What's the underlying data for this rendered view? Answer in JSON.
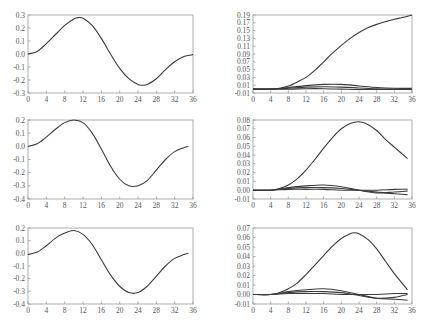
{
  "figure": {
    "rows": 3,
    "cols": 2,
    "line_color": "#3a3a3a",
    "frame_color": "#999999"
  },
  "chart_data": [
    {
      "type": "line",
      "panel": "row1-left",
      "title": "",
      "xlabel": "",
      "ylabel": "",
      "xlim": [
        0,
        36
      ],
      "ylim": [
        -0.3,
        0.3
      ],
      "xticks": [
        0,
        4,
        8,
        12,
        16,
        20,
        24,
        28,
        32,
        36
      ],
      "yticks": [
        -0.3,
        -0.2,
        -0.1,
        0.0,
        0.1,
        0.2,
        0.3
      ],
      "ytick_labels": [
        "-0.3",
        "-0.2",
        "-0.1",
        "0.0",
        "0.1",
        "0.2",
        "0.3"
      ],
      "grid": false,
      "legend": null,
      "series": [
        {
          "name": "response",
          "x": [
            0,
            2,
            4,
            6,
            8,
            10,
            11,
            12,
            14,
            16,
            18,
            20,
            22,
            24,
            25,
            26,
            28,
            30,
            32,
            34,
            36
          ],
          "values": [
            0.0,
            0.02,
            0.08,
            0.15,
            0.22,
            0.27,
            0.28,
            0.275,
            0.22,
            0.12,
            0.0,
            -0.11,
            -0.19,
            -0.235,
            -0.24,
            -0.235,
            -0.19,
            -0.12,
            -0.06,
            -0.02,
            -0.005
          ]
        }
      ]
    },
    {
      "type": "line",
      "panel": "row1-right",
      "title": "",
      "xlabel": "",
      "ylabel": "",
      "xlim": [
        0,
        36
      ],
      "ylim": [
        -0.01,
        0.19
      ],
      "xticks": [
        0,
        4,
        8,
        12,
        16,
        20,
        24,
        28,
        32,
        36
      ],
      "yticks": [
        -0.01,
        0.01,
        0.03,
        0.05,
        0.07,
        0.09,
        0.11,
        0.13,
        0.15,
        0.17,
        0.19
      ],
      "ytick_labels": [
        "-0.01",
        "0.01",
        "0.03",
        "0.05",
        "0.07",
        "0.09",
        "0.11",
        "0.13",
        "0.15",
        "0.17",
        "0.19"
      ],
      "grid": false,
      "legend": null,
      "series": [
        {
          "name": "s1",
          "x": [
            0,
            4,
            6,
            8,
            10,
            12,
            14,
            16,
            18,
            20,
            22,
            24,
            26,
            28,
            30,
            32,
            34,
            36
          ],
          "values": [
            0.0,
            0.0,
            0.002,
            0.008,
            0.018,
            0.03,
            0.048,
            0.07,
            0.092,
            0.112,
            0.13,
            0.145,
            0.157,
            0.166,
            0.173,
            0.179,
            0.184,
            0.19
          ]
        },
        {
          "name": "s2",
          "x": [
            0,
            4,
            8,
            12,
            16,
            20,
            24,
            28,
            32,
            36
          ],
          "values": [
            0.0,
            0.0,
            0.004,
            0.009,
            0.012,
            0.012,
            0.008,
            0.004,
            0.002,
            0.002
          ]
        },
        {
          "name": "s3",
          "x": [
            0,
            4,
            8,
            12,
            16,
            20,
            24,
            28,
            32,
            36
          ],
          "values": [
            0.0,
            0.0,
            0.002,
            0.005,
            0.006,
            0.005,
            0.003,
            0.001,
            0.0,
            0.0
          ]
        },
        {
          "name": "s4",
          "x": [
            0,
            4,
            8,
            12,
            16,
            20,
            24,
            28,
            32,
            36
          ],
          "values": [
            0.0,
            0.0,
            0.0,
            0.001,
            0.001,
            0.0,
            -0.001,
            -0.001,
            -0.001,
            -0.001
          ]
        }
      ]
    },
    {
      "type": "line",
      "panel": "row2-left",
      "title": "",
      "xlabel": "",
      "ylabel": "",
      "xlim": [
        0,
        36
      ],
      "ylim": [
        -0.4,
        0.2
      ],
      "xticks": [
        0,
        4,
        8,
        12,
        16,
        20,
        24,
        28,
        32,
        36
      ],
      "yticks": [
        -0.4,
        -0.3,
        -0.2,
        -0.1,
        0.0,
        0.1,
        0.2
      ],
      "ytick_labels": [
        "-0.4",
        "-0.3",
        "-0.2",
        "-0.1",
        "0.0",
        "0.1",
        "0.2"
      ],
      "grid": false,
      "legend": null,
      "series": [
        {
          "name": "response",
          "x": [
            0,
            2,
            4,
            6,
            8,
            10,
            12,
            14,
            16,
            18,
            20,
            22,
            24,
            26,
            28,
            30,
            32,
            34,
            35
          ],
          "values": [
            0.0,
            0.02,
            0.07,
            0.13,
            0.18,
            0.2,
            0.18,
            0.1,
            -0.02,
            -0.15,
            -0.25,
            -0.3,
            -0.3,
            -0.26,
            -0.18,
            -0.1,
            -0.04,
            -0.01,
            0.0
          ]
        }
      ]
    },
    {
      "type": "line",
      "panel": "row2-right",
      "title": "",
      "xlabel": "",
      "ylabel": "",
      "xlim": [
        0,
        36
      ],
      "ylim": [
        -0.01,
        0.08
      ],
      "xticks": [
        0,
        4,
        8,
        12,
        16,
        20,
        24,
        28,
        32,
        36
      ],
      "yticks": [
        -0.01,
        0.0,
        0.01,
        0.02,
        0.03,
        0.04,
        0.05,
        0.06,
        0.07,
        0.08
      ],
      "ytick_labels": [
        "-0.01",
        "0.00",
        "0.01",
        "0.02",
        "0.03",
        "0.04",
        "0.05",
        "0.06",
        "0.07",
        "0.08"
      ],
      "grid": false,
      "legend": null,
      "series": [
        {
          "name": "s1",
          "x": [
            0,
            4,
            6,
            8,
            10,
            12,
            14,
            16,
            18,
            20,
            22,
            24,
            26,
            28,
            30,
            32,
            35
          ],
          "values": [
            0.0,
            0.0,
            0.002,
            0.006,
            0.013,
            0.023,
            0.035,
            0.048,
            0.06,
            0.07,
            0.076,
            0.078,
            0.075,
            0.068,
            0.058,
            0.049,
            0.036
          ]
        },
        {
          "name": "s2",
          "x": [
            0,
            4,
            8,
            12,
            16,
            20,
            24,
            28,
            32,
            35
          ],
          "values": [
            0.0,
            0.0,
            0.003,
            0.005,
            0.006,
            0.004,
            0.0,
            -0.003,
            -0.002,
            -0.001
          ]
        },
        {
          "name": "s3",
          "x": [
            0,
            4,
            8,
            12,
            16,
            20,
            24,
            28,
            32,
            35
          ],
          "values": [
            0.0,
            0.0,
            0.002,
            0.003,
            0.003,
            0.002,
            0.0,
            -0.002,
            -0.004,
            -0.005
          ]
        },
        {
          "name": "s4",
          "x": [
            0,
            4,
            8,
            12,
            16,
            20,
            24,
            28,
            32,
            35
          ],
          "values": [
            0.0,
            0.0,
            0.001,
            0.001,
            0.001,
            0.0,
            0.0,
            0.0,
            0.001,
            0.001
          ]
        }
      ]
    },
    {
      "type": "line",
      "panel": "row3-left",
      "title": "",
      "xlabel": "",
      "ylabel": "",
      "xlim": [
        0,
        36
      ],
      "ylim": [
        -0.4,
        0.2
      ],
      "xticks": [
        0,
        4,
        8,
        12,
        16,
        20,
        24,
        28,
        32,
        36
      ],
      "yticks": [
        -0.4,
        -0.3,
        -0.2,
        -0.1,
        0.0,
        0.1,
        0.2
      ],
      "ytick_labels": [
        "-0.4",
        "-0.3",
        "-0.2",
        "-0.1",
        "0.0",
        "0.1",
        "0.2"
      ],
      "grid": false,
      "legend": null,
      "series": [
        {
          "name": "response",
          "x": [
            0,
            2,
            4,
            6,
            8,
            10,
            12,
            14,
            16,
            18,
            20,
            22,
            24,
            26,
            28,
            30,
            32,
            34,
            35
          ],
          "values": [
            -0.01,
            0.01,
            0.06,
            0.12,
            0.16,
            0.18,
            0.15,
            0.07,
            -0.05,
            -0.17,
            -0.26,
            -0.31,
            -0.31,
            -0.26,
            -0.18,
            -0.1,
            -0.04,
            -0.01,
            0.0
          ]
        }
      ]
    },
    {
      "type": "line",
      "panel": "row3-right",
      "title": "",
      "xlabel": "",
      "ylabel": "",
      "xlim": [
        0,
        36
      ],
      "ylim": [
        -0.01,
        0.07
      ],
      "xticks": [
        0,
        4,
        8,
        12,
        16,
        20,
        24,
        28,
        32,
        36
      ],
      "yticks": [
        -0.01,
        0.0,
        0.01,
        0.02,
        0.03,
        0.04,
        0.05,
        0.06,
        0.07
      ],
      "ytick_labels": [
        "-0.01",
        "0.00",
        "0.01",
        "0.02",
        "0.03",
        "0.04",
        "0.05",
        "0.06",
        "0.07"
      ],
      "grid": false,
      "legend": null,
      "series": [
        {
          "name": "s1",
          "x": [
            0,
            4,
            6,
            8,
            10,
            12,
            14,
            16,
            18,
            20,
            22,
            23,
            24,
            26,
            28,
            30,
            32,
            35
          ],
          "values": [
            0.0,
            0.0,
            0.002,
            0.006,
            0.012,
            0.021,
            0.031,
            0.041,
            0.051,
            0.059,
            0.064,
            0.065,
            0.064,
            0.058,
            0.048,
            0.035,
            0.022,
            0.005
          ]
        },
        {
          "name": "s2",
          "x": [
            0,
            4,
            8,
            12,
            16,
            20,
            24,
            28,
            32,
            35
          ],
          "values": [
            0.0,
            0.0,
            0.003,
            0.005,
            0.006,
            0.004,
            0.0,
            -0.004,
            -0.005,
            -0.006
          ]
        },
        {
          "name": "s3",
          "x": [
            0,
            4,
            8,
            12,
            16,
            20,
            24,
            28,
            32,
            35
          ],
          "values": [
            0.0,
            0.0,
            0.002,
            0.003,
            0.003,
            0.002,
            -0.001,
            -0.004,
            -0.003,
            0.0
          ]
        },
        {
          "name": "s4",
          "x": [
            0,
            4,
            8,
            12,
            16,
            20,
            24,
            28,
            32,
            35
          ],
          "values": [
            0.0,
            0.0,
            0.001,
            0.001,
            0.001,
            0.0,
            0.0,
            0.0,
            0.001,
            0.001
          ]
        }
      ]
    }
  ]
}
